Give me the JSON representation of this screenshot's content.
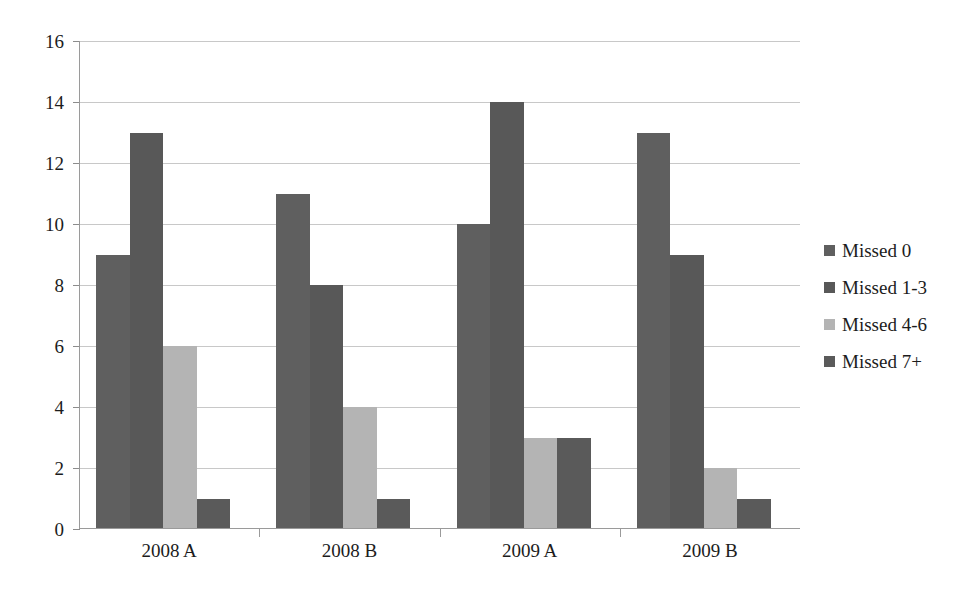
{
  "chart_data": {
    "type": "bar",
    "title": "Attendance",
    "xlabel": "",
    "ylabel": "",
    "ylim": [
      0,
      16
    ],
    "ytick_step": 2,
    "ytick_labels": [
      "0",
      "2",
      "4",
      "6",
      "8",
      "10",
      "12",
      "14",
      "16"
    ],
    "grid": true,
    "grid_axis": "y",
    "legend_position": "right",
    "categories": [
      "2008 A",
      "2008 B",
      "2009 A",
      "2009 B"
    ],
    "series": [
      {
        "name": "Missed 0",
        "color": "#5f5f5f",
        "values": [
          9,
          11,
          10,
          13
        ]
      },
      {
        "name": "Missed 1-3",
        "color": "#585858",
        "values": [
          13,
          8,
          14,
          9
        ]
      },
      {
        "name": "Missed 4-6",
        "color": "#b4b4b4",
        "values": [
          6,
          4,
          3,
          2
        ]
      },
      {
        "name": "Missed 7+",
        "color": "#5a5a5a",
        "values": [
          1,
          1,
          3,
          1
        ]
      }
    ]
  },
  "axes": {
    "y_max": 16,
    "y_min": 0
  }
}
